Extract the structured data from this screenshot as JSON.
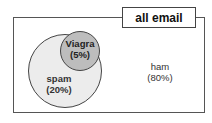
{
  "diagram": {
    "title": "all email",
    "sets": [
      {
        "id": "spam",
        "label": "spam",
        "percent": "(20%)"
      },
      {
        "id": "viagra",
        "label": "Viagra",
        "percent": "(5%)"
      },
      {
        "id": "ham",
        "label": "ham",
        "percent": "(80%)"
      }
    ],
    "colors": {
      "spam_fill": "#ececec",
      "viagra_fill": "#bdbdbd",
      "border": "#444444"
    }
  }
}
